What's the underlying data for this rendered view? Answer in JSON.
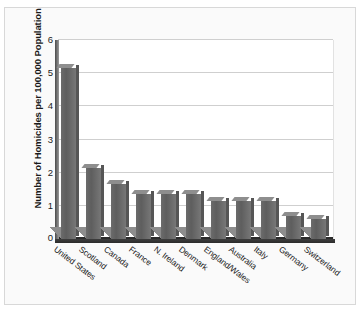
{
  "chart_data": {
    "type": "bar",
    "title": "",
    "subtitle": "",
    "xlabel": "",
    "ylabel": "Number of Homicides per 100,000 Population",
    "ylim": [
      0,
      6
    ],
    "yticks": [
      0,
      1,
      2,
      3,
      4,
      5,
      6
    ],
    "ytick_labels": [
      "0",
      "1",
      "2",
      "3",
      "4",
      "5",
      "6"
    ],
    "grid": true,
    "legend": null,
    "legend_position": "none",
    "categories": [
      "United States",
      "Scotland",
      "Canada",
      "France",
      "N. Ireland",
      "Denmark",
      "England/Wales",
      "Australia",
      "Italy",
      "Germany",
      "Switzerland"
    ],
    "values": [
      5.15,
      2.15,
      1.65,
      1.35,
      1.35,
      1.35,
      1.15,
      1.15,
      1.15,
      0.7,
      0.6
    ],
    "bar_color": "#6b6b6b",
    "bar_top_color": "#8e8e8e",
    "axis_color": "#2b2b2b",
    "grid_color": "#cfcfcf",
    "plot_background": "#ffffff",
    "page_background": "#fafafa"
  }
}
